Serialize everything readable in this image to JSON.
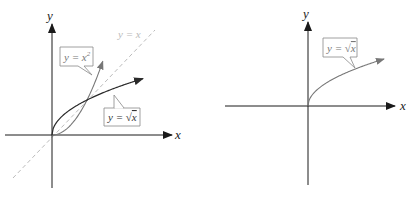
{
  "figure": {
    "left_panel": {
      "x_axis_label": "x",
      "y_axis_label": "y",
      "identity_line_label": "y = x",
      "curves": [
        {
          "name": "y = x^2",
          "callout": {
            "prefix": "y = x",
            "superscript": "2"
          },
          "color": "#777777"
        },
        {
          "name": "y = sqrt(x)",
          "callout": {
            "prefix": "y = ",
            "radical": "√",
            "radicand": "x"
          },
          "color": "#2a2a2a"
        }
      ],
      "intersection_points": [
        [
          0,
          0
        ],
        [
          1,
          1
        ]
      ]
    },
    "right_panel": {
      "x_axis_label": "x",
      "y_axis_label": "y",
      "curves": [
        {
          "name": "y = sqrt(x)",
          "callout": {
            "prefix": "y = ",
            "radical": "√",
            "radicand": "x"
          },
          "color": "#777777"
        }
      ]
    }
  }
}
